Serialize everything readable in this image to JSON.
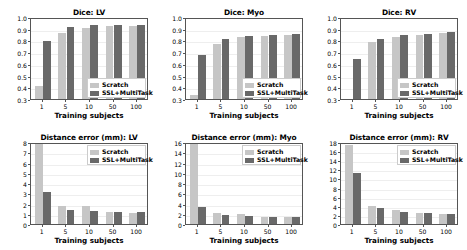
{
  "figure": {
    "background": "#ffffff",
    "scratch_color": "#c6c6c6",
    "ssl_color": "#696969"
  },
  "legend": {
    "scratch_label": "Scratch",
    "ssl_label": "SSL+MultiTask"
  },
  "common": {
    "xlabel": "Training subjects",
    "categories": [
      "1",
      "5",
      "10",
      "50",
      "100"
    ]
  },
  "chart_data": [
    {
      "id": "dice-lv",
      "type": "bar",
      "title": "Dice: LV",
      "xlabel": "Training subjects",
      "ylabel": "",
      "categories": [
        "1",
        "5",
        "10",
        "50",
        "100"
      ],
      "series": [
        {
          "name": "Scratch",
          "values": [
            0.415,
            0.863,
            0.909,
            0.921,
            0.921
          ]
        },
        {
          "name": "SSL+MultiTask",
          "values": [
            0.795,
            0.915,
            0.928,
            0.928,
            0.929
          ]
        }
      ],
      "ylim": [
        0.3,
        1.0
      ],
      "yticks": [
        0.3,
        0.4,
        0.5,
        0.6,
        0.7,
        0.8,
        0.9,
        1.0
      ],
      "ytick_labels": [
        "0.3",
        "0.4",
        "0.5",
        "0.6",
        "0.7",
        "0.8",
        "0.9",
        "1.0"
      ],
      "grid": true,
      "legend_position": "lower right"
    },
    {
      "id": "dice-myo",
      "type": "bar",
      "title": "Dice: Myo",
      "xlabel": "Training subjects",
      "ylabel": "",
      "categories": [
        "1",
        "5",
        "10",
        "50",
        "100"
      ],
      "series": [
        {
          "name": "Scratch",
          "values": [
            0.337,
            0.772,
            0.826,
            0.838,
            0.845
          ]
        },
        {
          "name": "SSL+MultiTask",
          "values": [
            0.672,
            0.812,
            0.842,
            0.845,
            0.853
          ]
        }
      ],
      "ylim": [
        0.3,
        1.0
      ],
      "yticks": [
        0.3,
        0.4,
        0.5,
        0.6,
        0.7,
        0.8,
        0.9,
        1.0
      ],
      "ytick_labels": [
        "0.3",
        "0.4",
        "0.5",
        "0.6",
        "0.7",
        "0.8",
        "0.9",
        "1.0"
      ],
      "grid": true,
      "legend_position": "lower right"
    },
    {
      "id": "dice-rv",
      "type": "bar",
      "title": "Dice: RV",
      "xlabel": "Training subjects",
      "ylabel": "",
      "categories": [
        "1",
        "5",
        "10",
        "50",
        "100"
      ],
      "series": [
        {
          "name": "Scratch",
          "values": [
            0.302,
            0.786,
            0.828,
            0.849,
            0.864
          ]
        },
        {
          "name": "SSL+MultiTask",
          "values": [
            0.641,
            0.815,
            0.846,
            0.855,
            0.868
          ]
        }
      ],
      "ylim": [
        0.3,
        1.0
      ],
      "yticks": [
        0.3,
        0.4,
        0.5,
        0.6,
        0.7,
        0.8,
        0.9,
        1.0
      ],
      "ytick_labels": [
        "0.3",
        "0.4",
        "0.5",
        "0.6",
        "0.7",
        "0.8",
        "0.9",
        "1.0"
      ],
      "grid": true,
      "legend_position": "lower right"
    },
    {
      "id": "dist-lv",
      "type": "bar",
      "title": "Distance error (mm): LV",
      "xlabel": "Training subjects",
      "ylabel": "",
      "categories": [
        "1",
        "5",
        "10",
        "50",
        "100"
      ],
      "series": [
        {
          "name": "Scratch",
          "values": [
            8.0,
            1.78,
            1.72,
            1.18,
            1.12
          ]
        },
        {
          "name": "SSL+MultiTask",
          "values": [
            3.12,
            1.35,
            1.25,
            1.22,
            1.17
          ]
        }
      ],
      "ylim": [
        0,
        8
      ],
      "yticks": [
        0,
        1,
        2,
        3,
        4,
        5,
        6,
        7,
        8
      ],
      "ytick_labels": [
        "0",
        "1",
        "2",
        "3",
        "4",
        "5",
        "6",
        "7",
        "8"
      ],
      "grid": true,
      "legend_position": "upper right"
    },
    {
      "id": "dist-myo",
      "type": "bar",
      "title": "Distance error (mm): Myo",
      "xlabel": "Training subjects",
      "ylabel": "",
      "categories": [
        "1",
        "5",
        "10",
        "50",
        "100"
      ],
      "series": [
        {
          "name": "Scratch",
          "values": [
            16.0,
            2.18,
            1.92,
            1.45,
            1.32
          ]
        },
        {
          "name": "SSL+MultiTask",
          "values": [
            3.25,
            1.72,
            1.55,
            1.45,
            1.32
          ]
        }
      ],
      "ylim": [
        0,
        16
      ],
      "yticks": [
        0,
        2,
        4,
        6,
        8,
        10,
        12,
        14,
        16
      ],
      "ytick_labels": [
        "0",
        "2",
        "4",
        "6",
        "8",
        "10",
        "12",
        "14",
        "16"
      ],
      "grid": true,
      "legend_position": "upper right"
    },
    {
      "id": "dist-rv",
      "type": "bar",
      "title": "Distance error (mm): RV",
      "xlabel": "Training subjects",
      "ylabel": "",
      "categories": [
        "1",
        "5",
        "10",
        "50",
        "100"
      ],
      "series": [
        {
          "name": "Scratch",
          "values": [
            17.4,
            4.0,
            3.0,
            2.35,
            2.1
          ]
        },
        {
          "name": "SSL+MultiTask",
          "values": [
            11.2,
            3.55,
            2.7,
            2.4,
            2.15
          ]
        }
      ],
      "ylim": [
        0,
        18
      ],
      "yticks": [
        0,
        2,
        4,
        6,
        8,
        10,
        12,
        14,
        16,
        18
      ],
      "ytick_labels": [
        "0",
        "2",
        "4",
        "6",
        "8",
        "10",
        "12",
        "14",
        "16",
        "18"
      ],
      "grid": true,
      "legend_position": "upper right"
    }
  ]
}
